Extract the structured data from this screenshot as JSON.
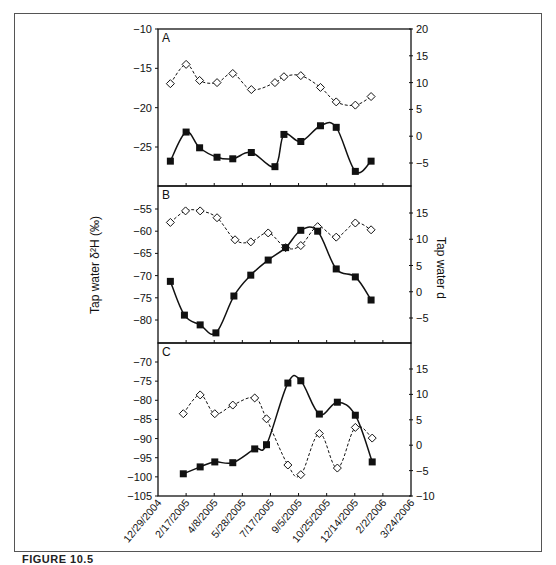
{
  "figure": {
    "caption": "FIGURE 10.5"
  },
  "chart_data": {
    "type": "line",
    "layout": "three vertically stacked panels sharing x-axis, dual y-axes",
    "left_ylabel": "Tap water δ²H (‰)",
    "right_ylabel": "Tap water d",
    "x_tick_labels": [
      "12/29/2004",
      "2/17/2005",
      "4/8/2005",
      "5/28/2005",
      "7/17/2005",
      "9/5/2005",
      "10/25/2005",
      "12/14/2005",
      "2/2/2006",
      "3/24/2006"
    ],
    "x_range_days": [
      0,
      450
    ],
    "grid": false,
    "series_styles": {
      "dH": {
        "marker": "filled-square",
        "line": "solid",
        "axis": "left",
        "color": "#111111"
      },
      "d": {
        "marker": "open-diamond",
        "line": "dashed",
        "axis": "right",
        "color": "#111111"
      }
    },
    "panels": [
      {
        "label": "A",
        "left_ylim": [
          -30,
          -10
        ],
        "left_ticks": [
          -10,
          -15,
          -20,
          -25
        ],
        "right_ylim": [
          -10,
          20
        ],
        "right_ticks": [
          20,
          15,
          10,
          5,
          0,
          -5
        ],
        "dH": {
          "x_days": [
            22,
            50,
            74,
            105,
            133,
            166,
            208,
            224,
            254,
            289,
            317,
            351,
            379
          ],
          "values": [
            -26.8,
            -23.1,
            -25.1,
            -26.3,
            -26.5,
            -25.7,
            -27.5,
            -23.4,
            -24.3,
            -22.3,
            -22.5,
            -28.1,
            -26.8
          ]
        },
        "d": {
          "x_days": [
            22,
            50,
            74,
            105,
            133,
            166,
            208,
            224,
            254,
            289,
            317,
            351,
            379
          ],
          "values": [
            9.8,
            13.4,
            10.4,
            10.0,
            11.7,
            8.7,
            10.0,
            11.1,
            11.3,
            9.1,
            6.4,
            5.8,
            7.4
          ]
        }
      },
      {
        "label": "B",
        "left_ylim": [
          -85,
          -51
        ],
        "left_ticks": [
          -55,
          -60,
          -65,
          -70,
          -75,
          -80
        ],
        "right_ylim": [
          -10,
          20
        ],
        "right_ticks": [
          15,
          10,
          5,
          0,
          -5
        ],
        "dH": {
          "x_days": [
            22,
            47,
            75,
            103,
            135,
            165,
            196,
            227,
            254,
            284,
            317,
            351,
            379
          ],
          "values": [
            -71.3,
            -78.9,
            -81.1,
            -82.9,
            -74.6,
            -69.9,
            -66.5,
            -63.7,
            -59.8,
            -60.0,
            -68.5,
            -70.3,
            -75.5
          ]
        },
        "d": {
          "x_days": [
            22,
            49,
            75,
            105,
            137,
            165,
            196,
            227,
            254,
            284,
            317,
            351,
            379
          ],
          "values": [
            13.2,
            15.4,
            15.4,
            14.1,
            9.9,
            9.5,
            11.2,
            8.4,
            8.8,
            12.4,
            10.4,
            13.1,
            11.8
          ]
        }
      },
      {
        "label": "C",
        "left_ylim": [
          -105,
          -65
        ],
        "left_ticks": [
          -70,
          -75,
          -80,
          -85,
          -90,
          -95,
          -100,
          -105
        ],
        "right_ylim": [
          -10,
          20
        ],
        "right_ticks": [
          15,
          10,
          5,
          0,
          -5,
          -10
        ],
        "dH": {
          "x_days": [
            45,
            75,
            101,
            133,
            172,
            193,
            231,
            254,
            287,
            319,
            351,
            381
          ],
          "values": [
            -99.2,
            -97.4,
            -96.1,
            -96.3,
            -92.7,
            -91.6,
            -75.5,
            -74.9,
            -83.6,
            -80.5,
            -83.9,
            -96.1
          ]
        },
        "d": {
          "x_days": [
            45,
            75,
            101,
            133,
            172,
            193,
            231,
            254,
            287,
            319,
            351,
            381
          ],
          "values": [
            6.2,
            9.9,
            6.2,
            7.9,
            9.3,
            5.2,
            -3.9,
            -5.8,
            2.3,
            -4.5,
            3.5,
            1.4
          ]
        }
      }
    ]
  }
}
